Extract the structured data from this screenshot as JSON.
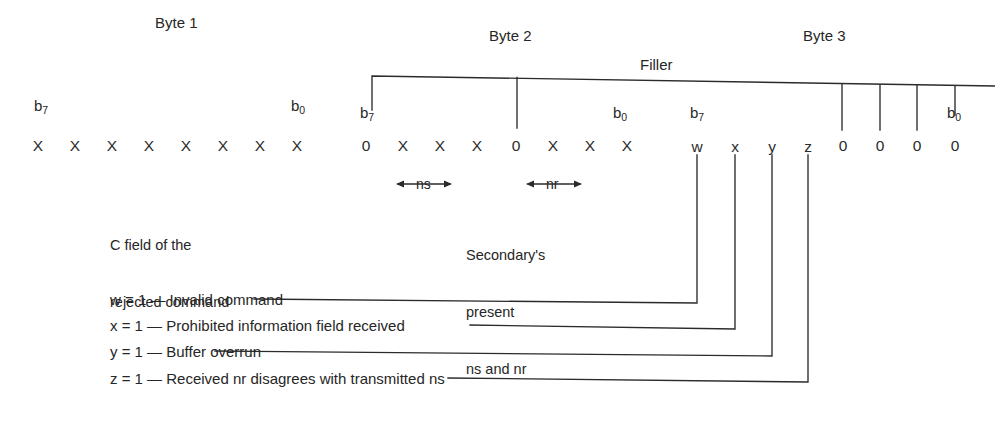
{
  "figure": {
    "title_visible": false,
    "background_color": "#ffffff",
    "line_color": "#2b2b2b",
    "text_color": "#262626"
  },
  "byte_titles": [
    {
      "label": "Byte 1"
    },
    {
      "label": "Byte 2"
    },
    {
      "label": "Byte 3"
    }
  ],
  "filler": {
    "label": "Filler"
  },
  "bit_markers": {
    "msb": "b",
    "msb_sub": "7",
    "lsb": "b",
    "lsb_sub": "0"
  },
  "bytes": [
    {
      "name": "Byte 1",
      "msb_label": "b",
      "msb_sub": "7",
      "lsb_label": "b",
      "lsb_sub": "0",
      "bits": [
        "X",
        "X",
        "X",
        "X",
        "X",
        "X",
        "X",
        "X"
      ]
    },
    {
      "name": "Byte 2",
      "msb_label": "b",
      "msb_sub": "7",
      "lsb_label": "b",
      "lsb_sub": "0",
      "bits": [
        "0",
        "X",
        "X",
        "X",
        "0",
        "X",
        "X",
        "X"
      ]
    },
    {
      "name": "Byte 3",
      "msb_label": "b",
      "msb_sub": "7",
      "lsb_label": "b",
      "lsb_sub": "0",
      "bits": [
        "w",
        "x",
        "y",
        "z",
        "0",
        "0",
        "0",
        "0"
      ]
    }
  ],
  "span_markers": [
    {
      "label": "ns",
      "arrow_left": "←",
      "arrow_right": "→"
    },
    {
      "label": "nr",
      "arrow_left": "←",
      "arrow_right": "→"
    }
  ],
  "notes": [
    {
      "lines": [
        "C field of the",
        "rejected command"
      ]
    },
    {
      "lines": [
        "Secondary's",
        "present",
        "ns and nr"
      ]
    }
  ],
  "legend": [
    {
      "bit": "w",
      "equals": "w = 1 — Invalid command"
    },
    {
      "bit": "x",
      "equals": "x = 1 — Prohibited information field received"
    },
    {
      "bit": "y",
      "equals": "y = 1 — Buffer overrun"
    },
    {
      "bit": "z",
      "equals": "z = 1 — Received nr disagrees with transmitted ns"
    }
  ]
}
